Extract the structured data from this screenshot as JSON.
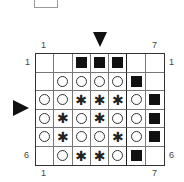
{
  "chart": {
    "col_labels": {
      "left": "1",
      "right": "7"
    },
    "row_labels": {
      "top": "1",
      "bottom": "6"
    },
    "symbols": {
      "square": "filled-square",
      "circle": "open-circle",
      "star": "✱"
    },
    "rows": [
      [
        "",
        "",
        "square",
        "square",
        "square",
        "",
        ""
      ],
      [
        "",
        "circle",
        "circle",
        "circle",
        "circle",
        "square",
        ""
      ],
      [
        "circle",
        "circle",
        "star",
        "star",
        "star",
        "circle",
        "square"
      ],
      [
        "circle",
        "star",
        "circle",
        "star",
        "circle",
        "circle",
        "square"
      ],
      [
        "circle",
        "star",
        "circle",
        "circle",
        "star",
        "circle",
        "square"
      ],
      [
        "",
        "circle",
        "star",
        "star",
        "circle",
        "square",
        ""
      ]
    ],
    "markers": {
      "column_arrow": "down-arrow-at-column-4",
      "row_arrow": "right-arrow-at-row-3"
    }
  }
}
